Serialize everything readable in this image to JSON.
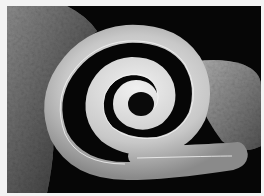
{
  "image": {
    "subject": "coiled-spiral-organism",
    "style": "grayscale electron micrograph",
    "colors": {
      "border": "#f3f3f3",
      "background": "#060606",
      "spiral_light": "#d9d9d9",
      "spiral_mid": "#9a9a9a",
      "rock": "#6a6a6a"
    }
  }
}
